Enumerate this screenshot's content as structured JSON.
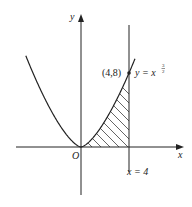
{
  "figure": {
    "curve_equation": {
      "prefix": "y = x",
      "exp_num": "3",
      "exp_den": "2"
    },
    "curve_formula": "y = x^(3/2)",
    "point": {
      "label": "(4,8)",
      "x": 4,
      "y": 8
    },
    "vertical_line": {
      "label": "x = 4",
      "x": 4
    },
    "axes": {
      "x_label": "x",
      "y_label": "y",
      "origin_label": "O"
    },
    "shaded_region": {
      "description": "area between curve and x-axis from x=0 to x=4",
      "from": 0,
      "to": 4
    },
    "colors": {
      "ink": "#222222",
      "background": "#ffffff"
    }
  }
}
